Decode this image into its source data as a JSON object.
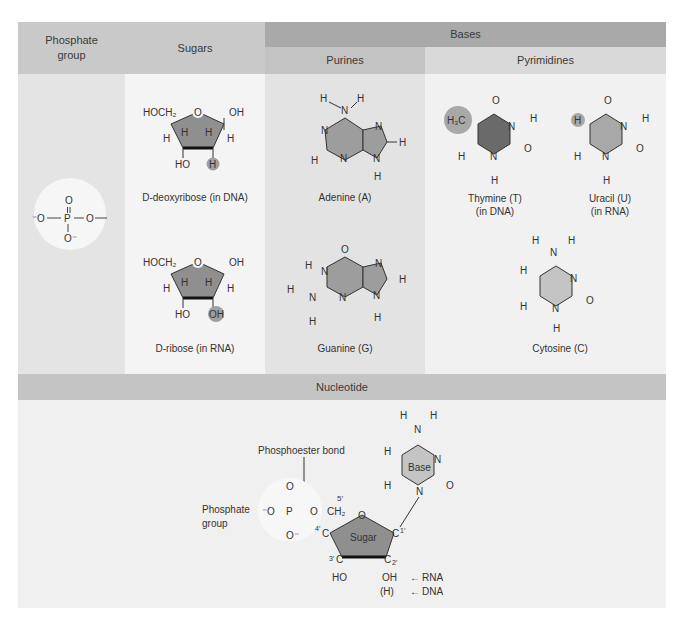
{
  "colors": {
    "header_light": "#c9c9c9",
    "header_dark": "#a8a8a8",
    "subheader_purines": "#c3c3c3",
    "subheader_pyrimidines": "#dcdcdc",
    "col_phosphate": "#e4e4e4",
    "col_sugars": "#f3f3f3",
    "col_purines": "#e2e2e2",
    "col_pyrimidines": "#f1f1f1",
    "nucleotide_bar": "#c4c4c4",
    "nucleotide_area": "#f0f0f0",
    "sugar_fill": "#8f8f8f",
    "purine_fill": "#9d9d9d",
    "thymine_fill": "#6a6a6a",
    "uracil_fill": "#a8a8a8",
    "cytosine_fill": "#c4c4c4",
    "highlight": "#a0a0a0"
  },
  "headers": {
    "phosphate": [
      "Phosphate",
      "group"
    ],
    "sugars": "Sugars",
    "bases": "Bases",
    "purines": "Purines",
    "pyrimidines": "Pyrimidines",
    "nucleotide": "Nucleotide"
  },
  "phosphate": {
    "atoms": {
      "o_top": "O",
      "o_left": "⁻O",
      "p": "P",
      "o_right": "O",
      "o_bottom": "O⁻"
    }
  },
  "sugars": [
    {
      "name": "D-deoxyribose (in DNA)",
      "caption_prefix": "D",
      "caption_rest": "-deoxyribose (in DNA)",
      "c5": "HOCH₂",
      "ring_o": "O",
      "c1_sub": "OH",
      "c3_sub": "HO",
      "c2_sub": "H",
      "c2_highlighted": true
    },
    {
      "name": "D-ribose (in RNA)",
      "caption_prefix": "D",
      "caption_rest": "-ribose (in RNA)",
      "c5": "HOCH₂",
      "ring_o": "O",
      "c1_sub": "OH",
      "c3_sub": "HO",
      "c2_sub": "OH",
      "c2_highlighted": true
    }
  ],
  "purines": [
    {
      "name": "Adenine (A)"
    },
    {
      "name": "Guanine (G)"
    }
  ],
  "pyrimidines": [
    {
      "name": "Thymine (T)",
      "note": "(in DNA)",
      "substituent": "H₃C"
    },
    {
      "name": "Uracil (U)",
      "note": "(in RNA)",
      "substituent": "H"
    },
    {
      "name": "Cytosine (C)",
      "note": ""
    }
  ],
  "nucleotide": {
    "phosphoester_label": "Phosphoester bond",
    "phosphate_label": [
      "Phosphate",
      "group"
    ],
    "sugar_label": "Sugar",
    "base_label": "Base",
    "primes": {
      "c5": "5′",
      "c4": "4′",
      "c3": "3′",
      "c2": "2′",
      "c1": "1′"
    },
    "rna_label": "RNA",
    "dna_label": "DNA",
    "c2_rna": "OH",
    "c2_dna": "(H)",
    "c3_sub": "HO"
  }
}
